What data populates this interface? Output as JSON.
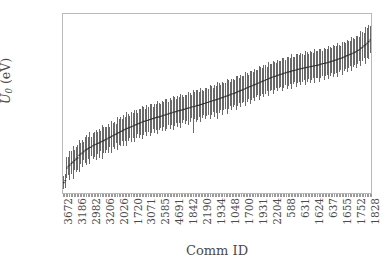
{
  "chart_data": {
    "type": "line",
    "title": "",
    "xlabel": "Comm ID",
    "ylabel": "U_0 (eV)",
    "ylabel_parts": {
      "symbol": "U",
      "subscript": "0",
      "units": "(eV)"
    },
    "ylim": [
      -103,
      -48
    ],
    "yticks": [
      -50,
      -60,
      -70,
      -80,
      -90,
      -100
    ],
    "ytick_labels": [
      "−50",
      "−60",
      "−70",
      "−80",
      "−90",
      "−100"
    ],
    "grid": false,
    "legend": null,
    "xtick_labels": [
      "3672",
      "3186",
      "2982",
      "3206",
      "2026",
      "1720",
      "3071",
      "2585",
      "4691",
      "1842",
      "2190",
      "1934",
      "1048",
      "1700",
      "1931",
      "2204",
      "588",
      "631",
      "1624",
      "637",
      "1655",
      "1752",
      "1828"
    ],
    "xtick_label_interval": 9,
    "n_points": 200,
    "series": [
      {
        "name": "U_0 mean with error bars",
        "marker": "errorbar",
        "color": "#2b2b2b",
        "errorbar_color": "#4d4d4d",
        "x": [
          0,
          1,
          2,
          3,
          4,
          5,
          6,
          7,
          8,
          9,
          10,
          11,
          12,
          13,
          14,
          15,
          16,
          17,
          18,
          19,
          20,
          21,
          22,
          23,
          24,
          25,
          26,
          27,
          28,
          29,
          30,
          31,
          32,
          33,
          34,
          35,
          36,
          37,
          38,
          39,
          40,
          41,
          42,
          43,
          44,
          45,
          46,
          47,
          48,
          49,
          50,
          51,
          52,
          53,
          54,
          55,
          56,
          57,
          58,
          59,
          60,
          61,
          62,
          63,
          64,
          65,
          66,
          67,
          68,
          69,
          70,
          71,
          72,
          73,
          74,
          75,
          76,
          77,
          78,
          79,
          80,
          81,
          82,
          83,
          84,
          85,
          86,
          87,
          88,
          89,
          90,
          91,
          92,
          93,
          94,
          95,
          96,
          97,
          98,
          99,
          100,
          101,
          102,
          103,
          104,
          105,
          106,
          107,
          108,
          109,
          110,
          111,
          112,
          113,
          114,
          115,
          116,
          117,
          118,
          119,
          120,
          121,
          122,
          123,
          124,
          125,
          126,
          127,
          128,
          129,
          130,
          131,
          132,
          133,
          134,
          135,
          136,
          137,
          138,
          139,
          140,
          141,
          142,
          143,
          144,
          145,
          146,
          147,
          148,
          149,
          150,
          151,
          152,
          153,
          154,
          155,
          156,
          157,
          158,
          159,
          160,
          161,
          162,
          163,
          164,
          165,
          166,
          167,
          168,
          169,
          170,
          171,
          172,
          173,
          174,
          175,
          176,
          177,
          178,
          179,
          180,
          181,
          182,
          183,
          184,
          185,
          186,
          187,
          188,
          189,
          190,
          191,
          192,
          193,
          194,
          195,
          196,
          197,
          198,
          199
        ],
        "values": [
          -99.8,
          -99.2,
          -95.3,
          -94.8,
          -94.4,
          -93.9,
          -93.5,
          -93.0,
          -92.6,
          -92.2,
          -91.4,
          -91.0,
          -90.7,
          -90.3,
          -89.9,
          -89.6,
          -89.3,
          -89.0,
          -88.8,
          -88.5,
          -88.2,
          -88.0,
          -87.8,
          -87.6,
          -87.3,
          -87.1,
          -86.9,
          -86.6,
          -86.4,
          -86.1,
          -85.9,
          -85.6,
          -85.4,
          -85.1,
          -84.9,
          -84.6,
          -84.4,
          -84.1,
          -83.9,
          -83.6,
          -83.4,
          -83.2,
          -83.0,
          -82.8,
          -82.6,
          -82.4,
          -82.2,
          -82.0,
          -81.8,
          -81.6,
          -81.4,
          -81.2,
          -81.0,
          -80.9,
          -80.7,
          -80.6,
          -80.4,
          -80.3,
          -80.1,
          -80.0,
          -79.8,
          -79.7,
          -79.6,
          -79.4,
          -79.3,
          -79.1,
          -79.0,
          -78.8,
          -78.7,
          -78.5,
          -78.4,
          -78.2,
          -78.1,
          -78.0,
          -77.8,
          -77.7,
          -77.6,
          -77.4,
          -77.3,
          -77.2,
          -77.0,
          -76.9,
          -76.8,
          -76.6,
          -76.5,
          -76.4,
          -76.2,
          -76.1,
          -76.0,
          -75.8,
          -75.7,
          -75.5,
          -75.4,
          -75.2,
          -75.1,
          -74.9,
          -74.8,
          -74.6,
          -74.5,
          -74.3,
          -74.2,
          -74.0,
          -73.8,
          -73.7,
          -73.5,
          -73.3,
          -73.2,
          -73.0,
          -72.8,
          -72.6,
          -72.5,
          -72.3,
          -72.1,
          -71.9,
          -71.7,
          -71.5,
          -71.3,
          -71.1,
          -70.9,
          -70.7,
          -70.5,
          -70.3,
          -70.1,
          -69.9,
          -69.7,
          -69.5,
          -69.3,
          -69.1,
          -68.9,
          -68.7,
          -68.5,
          -68.3,
          -68.1,
          -67.9,
          -67.7,
          -67.5,
          -67.3,
          -67.2,
          -67.0,
          -66.8,
          -66.7,
          -66.5,
          -66.4,
          -66.2,
          -66.1,
          -65.9,
          -65.8,
          -65.7,
          -65.5,
          -65.4,
          -65.3,
          -65.2,
          -65.0,
          -64.9,
          -64.8,
          -64.7,
          -64.6,
          -64.5,
          -64.4,
          -64.3,
          -64.2,
          -64.1,
          -64.0,
          -63.9,
          -63.8,
          -63.7,
          -63.6,
          -63.4,
          -63.3,
          -63.2,
          -63.1,
          -63.0,
          -62.8,
          -62.7,
          -62.5,
          -62.4,
          -62.2,
          -62.1,
          -61.9,
          -61.7,
          -61.6,
          -61.4,
          -61.2,
          -61.0,
          -60.8,
          -60.6,
          -60.4,
          -60.2,
          -60.0,
          -59.8,
          -59.5,
          -59.2,
          -58.9,
          -58.5,
          -58.2,
          -57.8,
          -57.4,
          -57.0,
          -56.5,
          -56.0
        ],
        "errors_low": [
          1.9,
          2.3,
          3.1,
          2.8,
          4.6,
          3.4,
          5.2,
          2.9,
          4.1,
          3.6,
          5.0,
          3.2,
          4.4,
          2.7,
          3.9,
          4.8,
          3.3,
          5.1,
          2.8,
          4.2,
          3.7,
          4.9,
          3.1,
          4.5,
          2.9,
          5.3,
          3.8,
          4.1,
          3.4,
          4.7,
          3.0,
          5.0,
          3.6,
          4.3,
          2.8,
          5.2,
          3.9,
          4.6,
          3.2,
          4.9,
          3.5,
          5.4,
          4.0,
          3.3,
          4.8,
          3.7,
          5.1,
          4.2,
          3.0,
          4.6,
          3.8,
          5.3,
          4.1,
          3.4,
          4.9,
          3.6,
          5.0,
          4.3,
          3.2,
          4.7,
          3.9,
          5.2,
          4.0,
          3.5,
          4.8,
          3.7,
          5.1,
          4.4,
          3.3,
          4.9,
          3.8,
          5.3,
          4.2,
          3.6,
          5.0,
          3.9,
          5.4,
          4.1,
          3.4,
          4.7,
          3.8,
          5.2,
          4.3,
          3.5,
          8.1,
          4.0,
          5.1,
          4.4,
          3.7,
          5.3,
          4.2,
          3.6,
          5.0,
          4.1,
          3.8,
          5.4,
          4.3,
          3.5,
          5.1,
          4.0,
          6.2,
          4.4,
          3.7,
          5.2,
          4.1,
          3.9,
          5.5,
          4.3,
          3.6,
          5.0,
          4.2,
          3.8,
          5.3,
          4.4,
          3.7,
          5.1,
          4.0,
          3.9,
          5.4,
          4.2,
          3.6,
          5.2,
          4.3,
          3.8,
          5.0,
          4.1,
          3.7,
          5.3,
          4.4,
          3.9,
          5.1,
          4.2,
          3.6,
          5.4,
          4.0,
          3.8,
          5.2,
          4.3,
          3.7,
          5.0,
          4.1,
          3.9,
          5.3,
          4.4,
          3.6,
          5.1,
          4.2,
          3.8,
          5.4,
          4.0,
          3.7,
          5.2,
          4.3,
          3.9,
          5.0,
          4.1,
          3.6,
          5.3,
          4.4,
          3.8,
          5.1,
          4.2,
          3.7,
          5.4,
          4.0,
          3.9,
          5.2,
          4.3,
          3.6,
          5.0,
          4.1,
          3.8,
          5.3,
          4.4,
          3.7,
          5.1,
          4.2,
          3.9,
          5.4,
          4.0,
          3.6,
          5.2,
          4.3,
          3.8,
          5.0,
          4.1,
          3.7,
          5.3,
          4.4,
          3.9,
          5.1,
          4.2,
          3.6,
          5.5,
          4.3,
          3.8,
          6.0,
          4.5,
          5.2,
          4.0,
          6.5
        ],
        "errors_high": [
          2.1,
          2.0,
          3.4,
          3.0,
          4.2,
          3.8,
          4.9,
          3.1,
          3.8,
          4.0,
          4.6,
          3.5,
          4.1,
          3.0,
          4.2,
          4.4,
          3.6,
          4.8,
          3.1,
          4.0,
          3.9,
          4.5,
          3.4,
          4.2,
          3.2,
          5.0,
          4.1,
          3.8,
          3.6,
          4.4,
          3.3,
          4.7,
          3.9,
          4.0,
          3.1,
          4.9,
          4.2,
          4.3,
          3.5,
          4.6,
          3.8,
          5.1,
          4.3,
          3.6,
          4.5,
          4.0,
          4.8,
          4.4,
          3.3,
          4.3,
          4.1,
          5.0,
          4.4,
          3.7,
          4.6,
          3.9,
          4.7,
          4.5,
          3.5,
          4.4,
          4.2,
          4.9,
          4.3,
          3.8,
          4.5,
          4.0,
          4.8,
          4.6,
          3.6,
          4.6,
          4.1,
          5.0,
          4.5,
          3.9,
          4.7,
          4.2,
          5.1,
          4.4,
          3.7,
          4.4,
          4.1,
          4.9,
          4.6,
          3.8,
          5.2,
          4.3,
          4.8,
          4.7,
          4.0,
          5.0,
          4.5,
          3.9,
          4.7,
          4.4,
          4.1,
          5.1,
          4.6,
          3.8,
          4.8,
          4.3,
          5.4,
          4.7,
          4.0,
          4.9,
          4.4,
          4.2,
          5.2,
          4.6,
          3.9,
          4.7,
          4.5,
          4.1,
          5.0,
          4.7,
          4.0,
          4.8,
          4.3,
          4.2,
          5.1,
          4.5,
          3.9,
          4.9,
          4.6,
          4.1,
          4.7,
          4.4,
          4.0,
          5.0,
          4.7,
          4.2,
          4.8,
          4.5,
          3.9,
          5.1,
          4.3,
          4.1,
          4.9,
          4.6,
          4.0,
          4.7,
          4.4,
          4.2,
          5.0,
          4.7,
          3.9,
          4.8,
          4.5,
          4.1,
          5.1,
          4.3,
          4.0,
          4.9,
          4.6,
          4.2,
          4.7,
          4.4,
          3.9,
          5.0,
          4.7,
          4.1,
          4.8,
          4.5,
          4.0,
          5.1,
          4.3,
          4.2,
          4.9,
          4.6,
          3.9,
          4.7,
          4.4,
          4.1,
          5.0,
          4.7,
          4.0,
          4.8,
          4.5,
          4.2,
          5.1,
          4.3,
          3.9,
          4.9,
          4.6,
          4.1,
          4.7,
          4.4,
          4.0,
          5.0,
          4.7,
          4.2,
          4.8,
          4.5,
          3.9,
          5.3,
          4.6,
          4.1,
          5.5,
          4.8,
          5.0,
          4.3,
          6.8
        ]
      }
    ]
  }
}
